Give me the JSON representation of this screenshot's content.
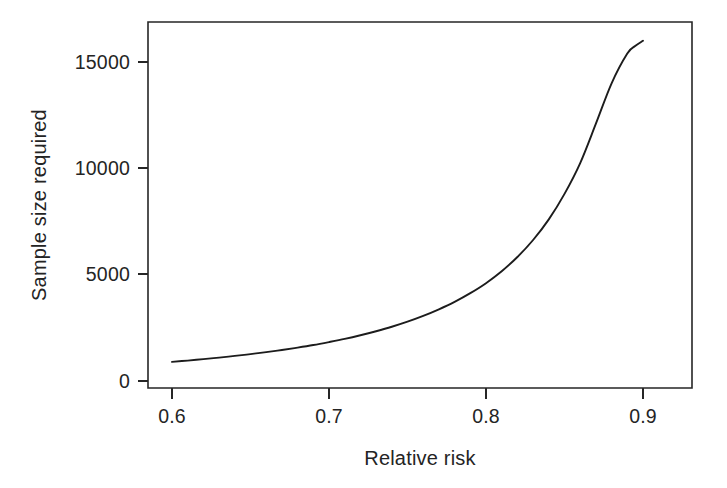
{
  "figure": {
    "background_color": "#ffffff",
    "axis_color": "#262626",
    "curve_color": "#1c1c1c"
  },
  "labels": {
    "xlabel": "Relative risk",
    "ylabel": "Sample size required",
    "x_ticks": [
      "0.6",
      "0.7",
      "0.8",
      "0.9"
    ],
    "y_ticks": [
      "0",
      "5000",
      "10000",
      "15000"
    ]
  },
  "chart_data": {
    "type": "line",
    "title": "",
    "subtitle": "",
    "xlabel": "Relative risk",
    "ylabel": "Sample size required",
    "xlim": [
      0.585,
      0.917
    ],
    "ylim": [
      -600,
      17200
    ],
    "xticks": [
      0.6,
      0.7,
      0.8,
      0.9
    ],
    "xticklabels": [
      "0.6",
      "0.7",
      "0.8",
      "0.9"
    ],
    "yticks": [
      0,
      5000,
      10000,
      15000
    ],
    "yticklabels": [
      "0",
      "5000",
      "10000",
      "15000"
    ],
    "grid": false,
    "legend": false,
    "legend_position": "none",
    "frame": "box",
    "series": [
      {
        "name": "Sample size required",
        "color": "#1c1c1c",
        "x": [
          0.6,
          0.61,
          0.62,
          0.63,
          0.64,
          0.65,
          0.66,
          0.67,
          0.68,
          0.69,
          0.7,
          0.71,
          0.72,
          0.73,
          0.74,
          0.75,
          0.76,
          0.77,
          0.78,
          0.79,
          0.8,
          0.81,
          0.82,
          0.83,
          0.84,
          0.85,
          0.86,
          0.87,
          0.88,
          0.89,
          0.895,
          0.9
        ],
        "y": [
          900,
          960,
          1030,
          1100,
          1180,
          1265,
          1360,
          1460,
          1570,
          1690,
          1830,
          1980,
          2150,
          2340,
          2550,
          2790,
          3060,
          3370,
          3720,
          4130,
          4600,
          5160,
          5830,
          6630,
          7600,
          8800,
          10250,
          12100,
          14000,
          15400,
          15750,
          16000
        ]
      }
    ],
    "annotations": []
  },
  "geometry": {
    "plot_left": 148,
    "plot_right": 692,
    "plot_top": 22,
    "plot_bottom": 388,
    "y_zero_px": 381,
    "y_15000_px": 62,
    "x_060_px": 172,
    "x_090_px": 643
  }
}
